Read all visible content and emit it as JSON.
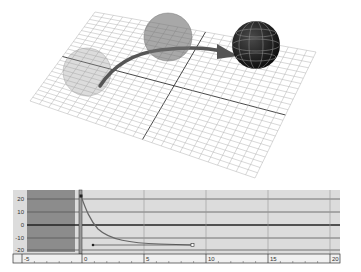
{
  "viewport": {
    "name": "3D perspective viewport",
    "grid": {
      "divisions": 24,
      "color": "#b0b0b0",
      "axis_color": "#333333"
    },
    "spheres": [
      {
        "name": "ghost-sphere-1",
        "opacity": 0.35,
        "color": "#8a8a8a"
      },
      {
        "name": "ghost-sphere-2",
        "opacity": 0.6,
        "color": "#6e6e6e"
      },
      {
        "name": "current-sphere",
        "opacity": 1.0,
        "color": "#1c1c1c"
      }
    ],
    "motion_path_color": "#555555"
  },
  "graph_editor": {
    "y_ticks": [
      "20",
      "10",
      "0",
      "-10",
      "-20"
    ],
    "x_ticks": [
      "-5",
      "0",
      "5",
      "10",
      "15",
      "20"
    ],
    "current_frame": "0",
    "colors": {
      "background": "#dcdcdc",
      "inactive_range": "#8c8c8c",
      "grid_line": "#555555",
      "zero_line": "#222222",
      "curve": "#666666"
    },
    "curve": {
      "start_value": 22,
      "end_value": -16,
      "start_frame": 0,
      "end_frame": 9
    }
  }
}
